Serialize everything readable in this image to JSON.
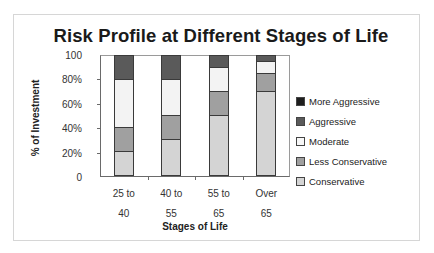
{
  "chart_data": {
    "type": "bar",
    "stacked": true,
    "percent_stacked": true,
    "title": "Risk Profile at Different Stages of Life",
    "xlabel": "Stages of Life",
    "ylabel": "% of Investment",
    "categories": [
      [
        "25 to",
        "40"
      ],
      [
        "40 to",
        "55"
      ],
      [
        "55 to",
        "65"
      ],
      [
        "Over",
        "65"
      ]
    ],
    "category_labels": [
      "25 to 40",
      "40 to 55",
      "55 to 65",
      "Over 65"
    ],
    "yticks": [
      "0",
      "20%",
      "40%",
      "60%",
      "80%",
      "100"
    ],
    "ylim": [
      0,
      100
    ],
    "grid": false,
    "legend_position": "right",
    "series": [
      {
        "name": "Conservative",
        "color": "#d4d4d4",
        "values": [
          20,
          30,
          50,
          70
        ]
      },
      {
        "name": "Less Conservative",
        "color": "#a0a0a0",
        "values": [
          20,
          20,
          20,
          15
        ]
      },
      {
        "name": "Moderate",
        "color": "#f3f3f3",
        "values": [
          40,
          30,
          20,
          10
        ]
      },
      {
        "name": "Aggressive",
        "color": "#5a5a5a",
        "values": [
          20,
          20,
          10,
          5
        ]
      },
      {
        "name": "More Aggressive",
        "color": "#1e1e1e",
        "values": [
          0,
          0,
          0,
          0
        ]
      }
    ],
    "legend": [
      {
        "name": "More Aggressive",
        "color": "#1e1e1e"
      },
      {
        "name": "Aggressive",
        "color": "#5a5a5a"
      },
      {
        "name": "Moderate",
        "color": "#f7f7f7"
      },
      {
        "name": "Less Conservative",
        "color": "#a0a0a0"
      },
      {
        "name": "Conservative",
        "color": "#d4d4d4"
      }
    ]
  }
}
